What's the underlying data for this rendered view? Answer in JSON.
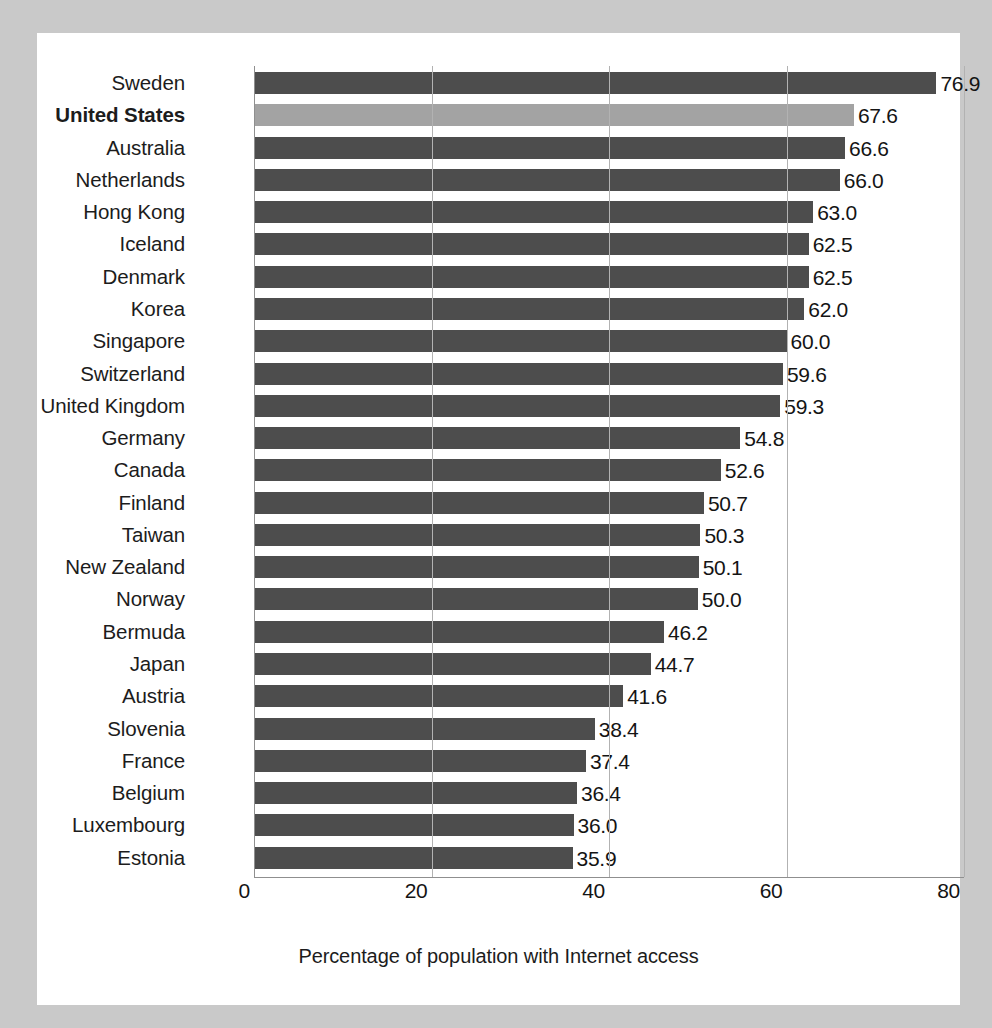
{
  "chart_data": {
    "type": "bar",
    "orientation": "horizontal",
    "title": "",
    "subtitle": "",
    "xlabel": "Percentage of population with Internet access",
    "ylabel": "",
    "xlim": [
      0,
      80
    ],
    "xticks": [
      "0",
      "20",
      "40",
      "60",
      "80"
    ],
    "xtick_values": [
      0,
      20,
      40,
      60,
      80
    ],
    "grid": "vertical",
    "legend": null,
    "highlight_category": "United States",
    "value_format": "one-decimal",
    "categories": [
      "Sweden",
      "United States",
      "Australia",
      "Netherlands",
      "Hong Kong",
      "Iceland",
      "Denmark",
      "Korea",
      "Singapore",
      "Switzerland",
      "United Kingdom",
      "Germany",
      "Canada",
      "Finland",
      "Taiwan",
      "New Zealand",
      "Norway",
      "Bermuda",
      "Japan",
      "Austria",
      "Slovenia",
      "France",
      "Belgium",
      "Luxembourg",
      "Estonia"
    ],
    "values": [
      76.9,
      67.6,
      66.6,
      66.0,
      63.0,
      62.5,
      62.5,
      62.0,
      60.0,
      59.6,
      59.3,
      54.8,
      52.6,
      50.7,
      50.3,
      50.1,
      50.0,
      46.2,
      44.7,
      41.6,
      38.4,
      37.4,
      36.4,
      36.0,
      35.9
    ],
    "value_labels": [
      "76.9",
      "67.6",
      "66.6",
      "66.0",
      "63.0",
      "62.5",
      "62.5",
      "62.0",
      "60.0",
      "59.6",
      "59.3",
      "54.8",
      "52.6",
      "50.7",
      "50.3",
      "50.1",
      "50.0",
      "46.2",
      "44.7",
      "41.6",
      "38.4",
      "37.4",
      "36.4",
      "36.0",
      "35.9"
    ],
    "colors": {
      "bar": "#4d4d4d",
      "bar_highlight": "#a3a3a3",
      "gridline": "#b2b2b2",
      "axis": "#8f8f8f",
      "panel_background": "#ffffff",
      "page_background": "#c9c9c9",
      "text": "#1c1c1c"
    }
  }
}
